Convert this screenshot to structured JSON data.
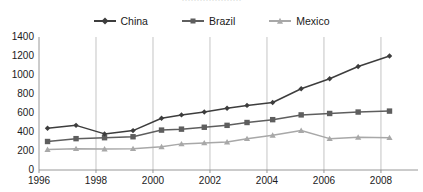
{
  "title_sliver": "····················",
  "legend": {
    "position": "top-center",
    "items": [
      {
        "label": "China",
        "marker": "diamond",
        "color": "#3d3d3d"
      },
      {
        "label": "Brazil",
        "marker": "square",
        "color": "#5e5e5e"
      },
      {
        "label": "Mexico",
        "marker": "triangle",
        "color": "#a8a8a8"
      }
    ]
  },
  "axes": {
    "y_ticks": [
      "0",
      "200",
      "400",
      "600",
      "800",
      "1000",
      "1200",
      "1400"
    ],
    "x_ticks": [
      "1996",
      "1998",
      "2000",
      "2002",
      "2004",
      "2006",
      "2008"
    ]
  },
  "colors": {
    "china": "#3d3d3d",
    "brazil": "#5e5e5e",
    "mexico": "#a8a8a8",
    "axis": "#8c8c8c",
    "grid": "#b5b5b5",
    "background": "#ffffff"
  },
  "chart_data": {
    "type": "line",
    "title": "",
    "subtitle": "",
    "xlabel": "",
    "ylabel": "",
    "xlim": [
      1996,
      2009.3
    ],
    "ylim": [
      0,
      1400
    ],
    "y_ticks": [
      0,
      200,
      400,
      600,
      800,
      1000,
      1200,
      1400
    ],
    "x_ticks": [
      1996,
      1998,
      2000,
      2002,
      2004,
      2006,
      2008
    ],
    "grid": "vertical-only",
    "legend_position": "top-center",
    "x": [
      1996.3,
      1997.3,
      1998.3,
      1999.3,
      2000.3,
      2001.0,
      2001.8,
      2002.6,
      2003.3,
      2004.2,
      2005.2,
      2006.2,
      2007.2,
      2008.3
    ],
    "series": [
      {
        "name": "China",
        "marker": "diamond",
        "color": "#3d3d3d",
        "values": [
          440,
          470,
          380,
          415,
          545,
          580,
          610,
          650,
          680,
          710,
          855,
          960,
          1090,
          1200
        ]
      },
      {
        "name": "Brazil",
        "marker": "square",
        "color": "#5e5e5e",
        "values": [
          300,
          330,
          340,
          350,
          420,
          430,
          450,
          470,
          500,
          530,
          580,
          595,
          610,
          620
        ]
      },
      {
        "name": "Mexico",
        "marker": "triangle",
        "color": "#a8a8a8",
        "values": [
          215,
          225,
          220,
          225,
          245,
          275,
          285,
          295,
          330,
          365,
          415,
          330,
          345,
          340
        ]
      }
    ]
  }
}
